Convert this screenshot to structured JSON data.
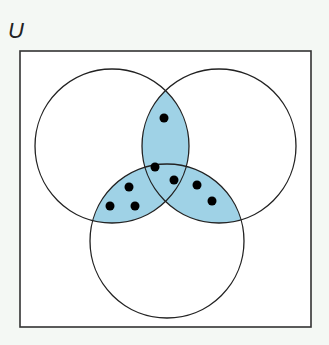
{
  "universe": {
    "label": "U",
    "box": {
      "x": 20,
      "y": 51,
      "width": 291,
      "height": 276
    },
    "fill": "#ffffff",
    "stroke": "#333333"
  },
  "sets": [
    {
      "name": "left",
      "cx": 112,
      "cy": 146,
      "r": 77
    },
    {
      "name": "right",
      "cx": 219,
      "cy": 146,
      "r": 77
    },
    {
      "name": "bottom",
      "cx": 167,
      "cy": 241,
      "r": 77
    }
  ],
  "shading": {
    "color": "#9fd2e6",
    "regions": [
      "left∩right",
      "left∩bottom",
      "right∩bottom"
    ]
  },
  "circle_stroke": "#222222",
  "dots": [
    {
      "region": "left∩right only",
      "cx": 164,
      "cy": 118
    },
    {
      "region": "left∩right∩bottom",
      "cx": 155,
      "cy": 167
    },
    {
      "region": "left∩right∩bottom",
      "cx": 174,
      "cy": 180
    },
    {
      "region": "left∩bottom only",
      "cx": 129,
      "cy": 187
    },
    {
      "region": "left∩bottom only",
      "cx": 110,
      "cy": 206
    },
    {
      "region": "left∩bottom only",
      "cx": 135,
      "cy": 206
    },
    {
      "region": "right∩bottom only",
      "cx": 197,
      "cy": 185
    },
    {
      "region": "right∩bottom only",
      "cx": 212,
      "cy": 201
    }
  ],
  "dot_radius": 4.5,
  "dot_color": "#000000"
}
